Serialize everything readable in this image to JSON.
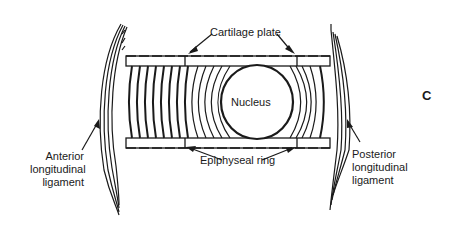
{
  "figure": {
    "panel_letter": "C",
    "labels": {
      "cartilage_plate": "Cartilage plate",
      "nucleus": "Nucleus",
      "epiphyseal_ring": "Epiphyseal ring",
      "anterior_ligament": [
        "Anterior",
        "longitudinal",
        "ligament"
      ],
      "posterior_ligament": [
        "Posterior",
        "longitudinal",
        "ligament"
      ]
    },
    "colors": {
      "ink": "#1a1a1a",
      "background": "#ffffff"
    }
  }
}
